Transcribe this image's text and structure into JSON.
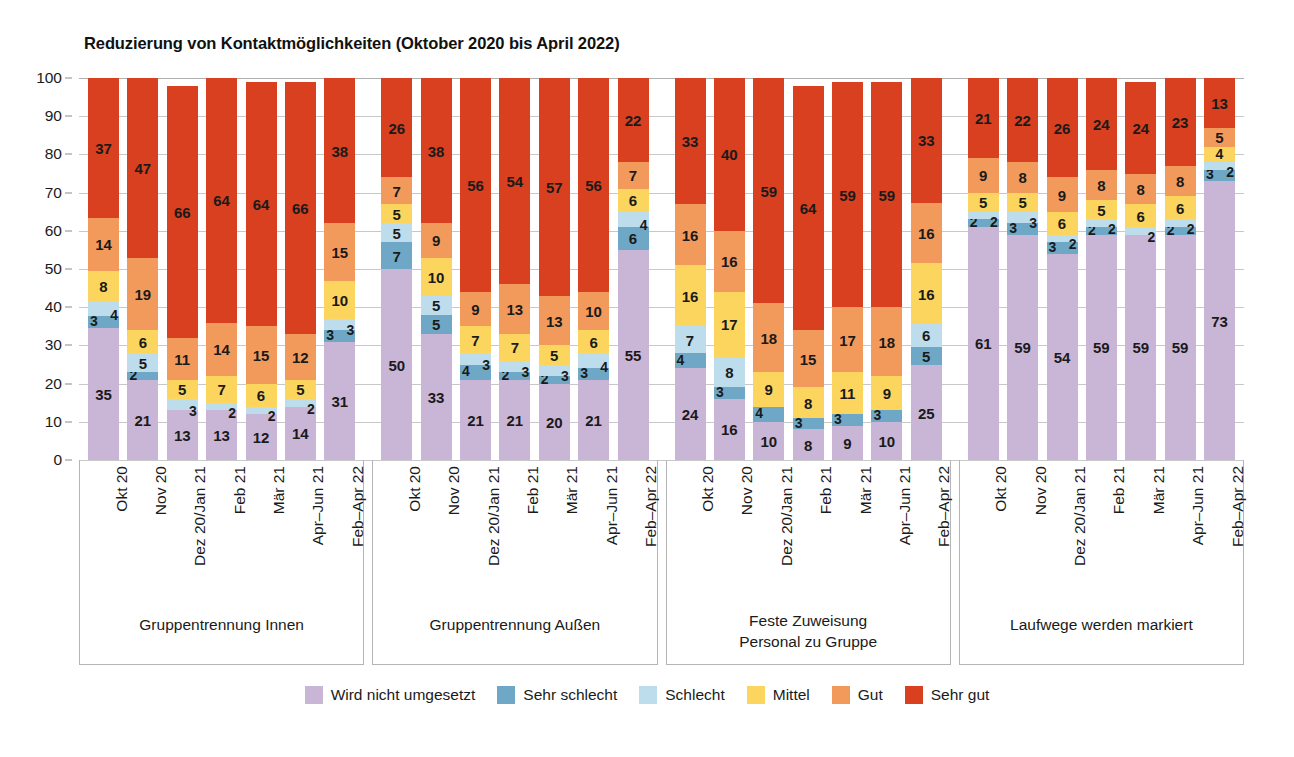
{
  "chart_data": {
    "type": "bar",
    "subtype": "stacked-percentage-grouped",
    "title": "Reduzierung von Kontaktmöglichkeiten (Oktober 2020 bis April 2022)",
    "xlabel": "",
    "ylabel": "",
    "ylim": [
      0,
      100
    ],
    "yticks": [
      0,
      10,
      20,
      30,
      40,
      50,
      60,
      70,
      80,
      90,
      100
    ],
    "grid": true,
    "legend_position": "bottom",
    "legend": [
      {
        "name": "Wird nicht umgesetzt",
        "color": "#c9b5d6"
      },
      {
        "name": "Sehr schlecht",
        "color": "#6fa8c6"
      },
      {
        "name": "Schlecht",
        "color": "#bddcec"
      },
      {
        "name": "Mittel",
        "color": "#fcd55f"
      },
      {
        "name": "Gut",
        "color": "#f29a5c"
      },
      {
        "name": "Sehr gut",
        "color": "#d8401f"
      }
    ],
    "series": [
      {
        "name": "Wird nicht umgesetzt",
        "color": "#c9b5d6"
      },
      {
        "name": "Sehr schlecht",
        "color": "#6fa8c6"
      },
      {
        "name": "Schlecht",
        "color": "#bddcec"
      },
      {
        "name": "Mittel",
        "color": "#fcd55f"
      },
      {
        "name": "Gut",
        "color": "#f29a5c"
      },
      {
        "name": "Sehr gut",
        "color": "#d8401f"
      }
    ],
    "categories": [
      "Okt 20",
      "Nov 20",
      "Dez 20/Jan 21",
      "Feb 21",
      "Mär 21",
      "Apr–Jun 21",
      "Feb–Apr 22"
    ],
    "groups": [
      {
        "label": "Gruppentrennung Innen",
        "label_lines": [
          "Gruppentrennung Innen"
        ],
        "bars": [
          {
            "category": "Okt 20",
            "values": [
              35,
              3,
              4,
              8,
              14,
              37
            ]
          },
          {
            "category": "Nov 20",
            "values": [
              21,
              2,
              5,
              6,
              19,
              47
            ]
          },
          {
            "category": "Dez 20/Jan 21",
            "values": [
              13,
              0,
              3,
              5,
              11,
              66
            ]
          },
          {
            "category": "Feb 21",
            "values": [
              13,
              0,
              2,
              7,
              14,
              64
            ]
          },
          {
            "category": "Mär 21",
            "values": [
              12,
              0,
              2,
              6,
              15,
              64
            ]
          },
          {
            "category": "Apr–Jun 21",
            "values": [
              14,
              0,
              2,
              5,
              12,
              66
            ]
          },
          {
            "category": "Feb–Apr 22",
            "values": [
              31,
              3,
              3,
              10,
              15,
              38
            ]
          }
        ]
      },
      {
        "label": "Gruppentrennung Außen",
        "label_lines": [
          "Gruppentrennung Außen"
        ],
        "bars": [
          {
            "category": "Okt 20",
            "values": [
              50,
              7,
              5,
              5,
              7,
              26
            ]
          },
          {
            "category": "Nov 20",
            "values": [
              33,
              5,
              5,
              10,
              9,
              38
            ]
          },
          {
            "category": "Dez 20/Jan 21",
            "values": [
              21,
              4,
              3,
              7,
              9,
              56
            ]
          },
          {
            "category": "Feb 21",
            "values": [
              21,
              2,
              3,
              7,
              13,
              54
            ]
          },
          {
            "category": "Mär 21",
            "values": [
              20,
              2,
              3,
              5,
              13,
              57
            ]
          },
          {
            "category": "Apr–Jun 21",
            "values": [
              21,
              3,
              4,
              6,
              10,
              56
            ]
          },
          {
            "category": "Feb–Apr 22",
            "values": [
              55,
              6,
              4,
              6,
              7,
              22
            ]
          }
        ]
      },
      {
        "label": "Feste Zuweisung Personal zu Gruppe",
        "label_lines": [
          "Feste Zuweisung",
          "Personal zu Gruppe"
        ],
        "bars": [
          {
            "category": "Okt 20",
            "values": [
              24,
              4,
              7,
              16,
              16,
              33
            ]
          },
          {
            "category": "Nov 20",
            "values": [
              16,
              3,
              8,
              17,
              16,
              40
            ]
          },
          {
            "category": "Dez 20/Jan 21",
            "values": [
              10,
              4,
              0,
              9,
              18,
              59
            ]
          },
          {
            "category": "Feb 21",
            "values": [
              8,
              3,
              0,
              8,
              15,
              64
            ]
          },
          {
            "category": "Mär 21",
            "values": [
              9,
              3,
              0,
              11,
              17,
              59
            ]
          },
          {
            "category": "Apr–Jun 21",
            "values": [
              10,
              3,
              0,
              9,
              18,
              59
            ]
          },
          {
            "category": "Feb–Apr 22",
            "values": [
              25,
              5,
              6,
              16,
              16,
              33
            ]
          }
        ]
      },
      {
        "label": "Laufwege werden markiert",
        "label_lines": [
          "Laufwege werden markiert"
        ],
        "bars": [
          {
            "category": "Okt 20",
            "values": [
              61,
              2,
              2,
              5,
              9,
              21
            ]
          },
          {
            "category": "Nov 20",
            "values": [
              59,
              3,
              3,
              5,
              8,
              22
            ]
          },
          {
            "category": "Dez 20/Jan 21",
            "values": [
              54,
              3,
              2,
              6,
              9,
              26
            ]
          },
          {
            "category": "Feb 21",
            "values": [
              59,
              2,
              2,
              5,
              8,
              24
            ]
          },
          {
            "category": "Mär 21",
            "values": [
              59,
              0,
              2,
              6,
              8,
              24
            ]
          },
          {
            "category": "Apr–Jun 21",
            "values": [
              59,
              2,
              2,
              6,
              8,
              23
            ]
          },
          {
            "category": "Feb–Apr 22",
            "values": [
              73,
              3,
              2,
              4,
              5,
              13
            ]
          }
        ]
      }
    ]
  }
}
